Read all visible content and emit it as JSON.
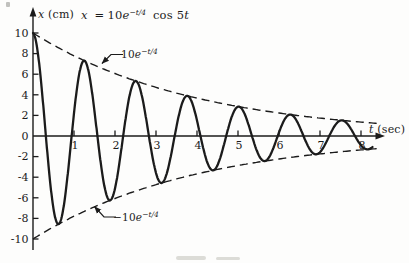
{
  "figure": {
    "equation": {
      "lhs": "x",
      "rel": "=",
      "amp": "10",
      "base": "e",
      "exp": "−t/4",
      "func": "cos",
      "coef": "5",
      "tvar": "t"
    },
    "y_axis_label": {
      "variable": "x",
      "unit": "(cm)"
    },
    "x_axis_label": {
      "variable": "t",
      "unit": "(sec)"
    },
    "upper_envelope_label": {
      "amp": "10",
      "base": "e",
      "exp": "−t/4"
    },
    "lower_envelope_label": {
      "amp": "−10",
      "base": "e",
      "exp": "−t/4"
    }
  },
  "chart_data": {
    "type": "line",
    "xlabel": "t (sec)",
    "ylabel": "x (cm)",
    "xlim": [
      0,
      8.6
    ],
    "ylim": [
      -10,
      10
    ],
    "x_ticks": [
      1,
      2,
      3,
      4,
      5,
      6,
      7,
      8
    ],
    "y_ticks": [
      10,
      8,
      6,
      4,
      2,
      0,
      -2,
      -4,
      -6,
      -8,
      -10
    ],
    "grid": false,
    "series": [
      {
        "name": "x(t) = 10 e^(−t/4) cos 5t",
        "role": "curve",
        "amplitude": 10,
        "decay_rate": 0.25,
        "angular_frequency": 5,
        "t_start": 0,
        "t_end": 8.28,
        "style": "solid"
      },
      {
        "name": "upper envelope 10 e^(−t/4)",
        "role": "envelope",
        "amplitude": 10,
        "decay_rate": 0.25,
        "angular_frequency": 0,
        "t_start": 0,
        "t_end": 8.42,
        "style": "dashed"
      },
      {
        "name": "lower envelope −10 e^(−t/4)",
        "role": "envelope",
        "amplitude": -10,
        "decay_rate": 0.25,
        "angular_frequency": 0,
        "t_start": 0,
        "t_end": 8.42,
        "style": "dashed"
      }
    ],
    "peak_points": [
      {
        "t": 0,
        "x": 10
      },
      {
        "t": 1.26,
        "x": 7.3
      },
      {
        "t": 2.51,
        "x": 5.3
      },
      {
        "t": 3.77,
        "x": 3.9
      },
      {
        "t": 5.03,
        "x": 2.8
      },
      {
        "t": 6.28,
        "x": 2.1
      },
      {
        "t": 7.54,
        "x": 1.5
      }
    ],
    "trough_points": [
      {
        "t": 0.63,
        "x": -8.5
      },
      {
        "t": 1.88,
        "x": -6.2
      },
      {
        "t": 3.14,
        "x": -4.6
      },
      {
        "t": 4.4,
        "x": -3.3
      },
      {
        "t": 5.65,
        "x": -2.4
      },
      {
        "t": 6.91,
        "x": -1.8
      },
      {
        "t": 8.17,
        "x": -1.3
      }
    ]
  }
}
